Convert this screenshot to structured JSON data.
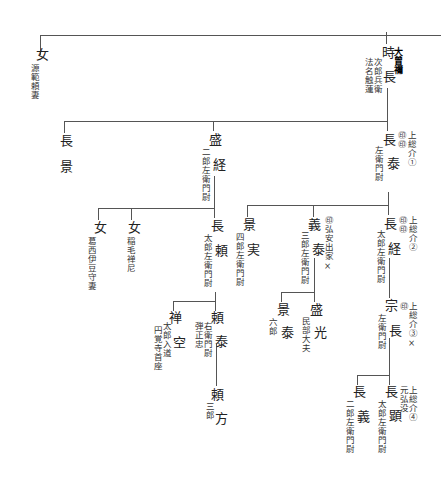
{
  "diagram": {
    "type": "genealogy",
    "nodes": {
      "tokinaga": {
        "name_top": "時",
        "name_bottom": "長",
        "label_bold": "大曾禰",
        "note1": "次郎兵衛",
        "note2": "法名触蓮"
      },
      "onna_top": {
        "name": "女",
        "note": "源範頼妻"
      },
      "nagakage": {
        "name_top": "長",
        "name_bottom": "景"
      },
      "morotsune": {
        "name_top": "盛",
        "name_bottom": "経",
        "note": "二郎左衛門尉"
      },
      "nagayasu": {
        "name_top": "長",
        "name_bottom": "泰",
        "note": "左衛門尉",
        "marks": "㊞㊞",
        "title": "上総介①"
      },
      "onna_a": {
        "name": "女",
        "note": "葛西伊豆守妻"
      },
      "onna_b": {
        "name": "女",
        "note": "稲毛禅尼"
      },
      "nagayori": {
        "name_top": "長",
        "name_bottom": "頼",
        "note": "太郎左衛門尉"
      },
      "kagezane": {
        "name_top": "景",
        "name_bottom": "実",
        "note": "四郎左衛門尉"
      },
      "yoshiyasu": {
        "name_top": "義",
        "name_bottom": "泰",
        "note": "三郎左衛門尉",
        "title": "㊞弘安出家×"
      },
      "nagatsune": {
        "name_top": "長",
        "name_bottom": "経",
        "note": "太郎左衛門尉",
        "marks": "㊞㊞",
        "title": "上総介②"
      },
      "zenku": {
        "name_top": "禅",
        "name_bottom": "空",
        "note1": "太郎入道",
        "note2": "円覚寺首座"
      },
      "yoriyasu": {
        "name_top": "頼",
        "name_bottom": "泰",
        "note1": "右衛門尉",
        "note2": "弾正忠"
      },
      "kageyasu": {
        "name_top": "景",
        "name_bottom": "泰",
        "note": "六郎"
      },
      "morimitsu": {
        "name_top": "盛",
        "name_bottom": "光",
        "note": "民部大夫"
      },
      "munenaga": {
        "name_top": "宗",
        "name_bottom": "長",
        "note": "左衛門尉",
        "marks": "㊞",
        "title": "上総介③×"
      },
      "yorikata": {
        "name_top": "頼",
        "name_bottom": "方",
        "note": "三郎"
      },
      "nagayoshi": {
        "name_top": "長",
        "name_bottom": "義",
        "note": "二郎左衛門尉"
      },
      "nagaaki": {
        "name_top": "長",
        "name_bottom": "顕",
        "note": "太郎左衛門尉",
        "title1": "上総介④",
        "title2": "元弘没"
      }
    }
  }
}
